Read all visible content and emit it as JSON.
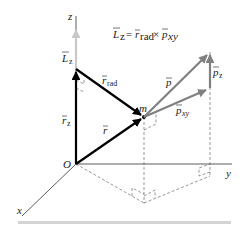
{
  "figure": {
    "equation": {
      "lhs": "L",
      "lhs_sub": "z",
      "equals": "=",
      "term1": "r",
      "term1_sub": "rad",
      "times": "×",
      "term2": "p",
      "term2_sub": "xy"
    },
    "axes": {
      "z_label": "z",
      "y_label": "y",
      "x_label": "x",
      "origin_label": "O"
    },
    "particle_label": "m",
    "vectors": [
      {
        "id": "L_z",
        "symbol": "L",
        "sub": "z",
        "color": "#c8c8c8"
      },
      {
        "id": "r_z",
        "symbol": "r",
        "sub": "z",
        "color": "#000000"
      },
      {
        "id": "r_rad",
        "symbol": "r",
        "sub": "rad",
        "color": "#000000"
      },
      {
        "id": "r",
        "symbol": "r",
        "sub": "",
        "color": "#000000"
      },
      {
        "id": "p",
        "symbol": "p",
        "sub": "",
        "color": "#808080"
      },
      {
        "id": "p_xy",
        "symbol": "p",
        "sub": "xy",
        "color": "#808080"
      },
      {
        "id": "p_z",
        "symbol": "p",
        "sub": "z",
        "color": "#808080"
      }
    ],
    "colors": {
      "position_vectors": "#000000",
      "momentum_vectors": "#808080",
      "angular_momentum": "#c8c8c8",
      "axes": "#333333",
      "dashed": "#555555",
      "footer_bar": "#d4d4d4"
    }
  }
}
